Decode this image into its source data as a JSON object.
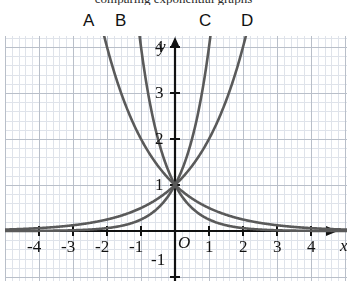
{
  "top_partial_text": "comparing exponential graphs",
  "curve_labels": [
    {
      "id": "A",
      "text": "A",
      "x": 83,
      "y": 12
    },
    {
      "id": "B",
      "text": "B",
      "x": 115,
      "y": 12
    },
    {
      "id": "C",
      "text": "C",
      "x": 199,
      "y": 12
    },
    {
      "id": "D",
      "text": "D",
      "x": 241,
      "y": 12
    }
  ],
  "axis_names": {
    "x": "x",
    "y": "y"
  },
  "origin_label": "O",
  "colors": {
    "curve": "#5a5a5a",
    "axis": "#111111",
    "grid_major": "#b9bfc9",
    "grid_minor": "#dfe3ea",
    "text": "#111111",
    "background": "#ffffff"
  },
  "chart_data": {
    "type": "line",
    "title": "",
    "xlabel": "x",
    "ylabel": "y",
    "xlim": [
      -4.9,
      4.6
    ],
    "ylim": [
      -1.4,
      4.55
    ],
    "xticks": [
      -4,
      -3,
      -2,
      -1,
      1,
      2,
      3,
      4
    ],
    "yticks": [
      -1,
      1,
      2,
      3,
      4
    ],
    "xtick_labels": [
      "-4",
      "-3",
      "-2",
      "-1",
      "1",
      "2",
      "3",
      "4"
    ],
    "ytick_labels": [
      "-1",
      "1",
      "2",
      "3",
      "4"
    ],
    "grid": true,
    "legend": "curve-end labels A, B, C, D above plot",
    "common_point": [
      0,
      1
    ],
    "series": [
      {
        "name": "A",
        "equation": "y = 4^(-x)",
        "base": 4,
        "sign": -1,
        "points": [
          [
            -1.2,
            5.28
          ],
          [
            -1,
            4
          ],
          [
            -0.75,
            2.83
          ],
          [
            -0.5,
            2
          ],
          [
            -0.25,
            1.41
          ],
          [
            0,
            1
          ],
          [
            0.5,
            0.5
          ],
          [
            1,
            0.25
          ],
          [
            2,
            0.0625
          ],
          [
            3,
            0.0156
          ],
          [
            4,
            0.0039
          ]
        ]
      },
      {
        "name": "B",
        "equation": "y = 2^(-x)",
        "base": 2,
        "sign": -1,
        "points": [
          [
            -2.4,
            5.28
          ],
          [
            -2,
            4
          ],
          [
            -1.5,
            2.83
          ],
          [
            -1,
            2
          ],
          [
            -0.5,
            1.41
          ],
          [
            0,
            1
          ],
          [
            1,
            0.5
          ],
          [
            2,
            0.25
          ],
          [
            3,
            0.125
          ],
          [
            4,
            0.0625
          ]
        ]
      },
      {
        "name": "C",
        "equation": "y = 4^x",
        "base": 4,
        "sign": 1,
        "points": [
          [
            -4,
            0.0039
          ],
          [
            -3,
            0.0156
          ],
          [
            -2,
            0.0625
          ],
          [
            -1,
            0.25
          ],
          [
            -0.5,
            0.5
          ],
          [
            0,
            1
          ],
          [
            0.25,
            1.41
          ],
          [
            0.5,
            2
          ],
          [
            0.75,
            2.83
          ],
          [
            1,
            4
          ],
          [
            1.2,
            5.28
          ]
        ]
      },
      {
        "name": "D",
        "equation": "y = 2^x",
        "base": 2,
        "sign": 1,
        "points": [
          [
            -4,
            0.0625
          ],
          [
            -3,
            0.125
          ],
          [
            -2,
            0.25
          ],
          [
            -1,
            0.5
          ],
          [
            0,
            1
          ],
          [
            0.5,
            1.41
          ],
          [
            1,
            2
          ],
          [
            1.5,
            2.83
          ],
          [
            2,
            4
          ],
          [
            2.4,
            5.28
          ]
        ]
      }
    ]
  }
}
